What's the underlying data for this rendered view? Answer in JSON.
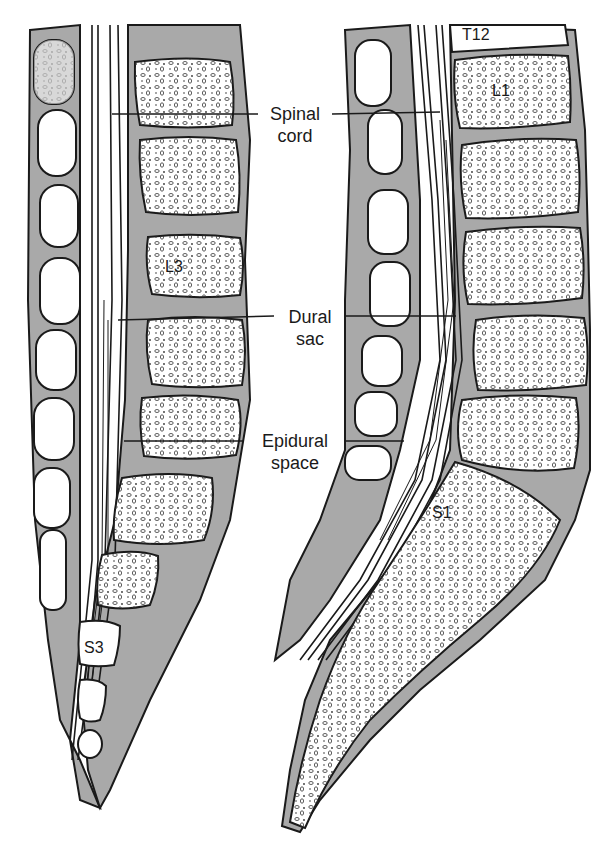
{
  "diagram": {
    "panels": [
      {
        "id": "left",
        "description": "Sagittal view of lumbar spine, sacrum and coccyx"
      },
      {
        "id": "right",
        "description": "Sagittal view of thoracolumbar spine and sacrum"
      }
    ],
    "center_labels": [
      {
        "line1": "Spinal",
        "line2": "cord"
      },
      {
        "line1": "Dural",
        "line2": "sac"
      },
      {
        "line1": "Epidural",
        "line2": "space"
      }
    ],
    "vertebra_labels": {
      "left_l3": "L3",
      "left_s3": "S3",
      "right_t12": "T12",
      "right_l1": "L1",
      "right_s1": "S1"
    },
    "colors": {
      "background": "#ffffff",
      "tissue_shade": "#a9a9a9",
      "bone_fill": "#ffffff",
      "outline": "#1a1a1a"
    }
  }
}
